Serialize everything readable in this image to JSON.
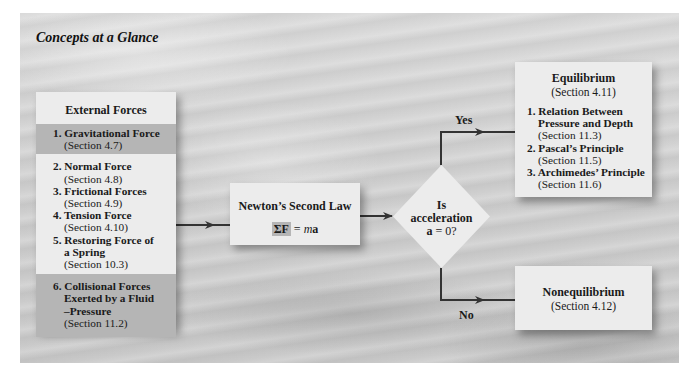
{
  "title": "Concepts at a Glance",
  "external_forces": {
    "header": "External Forces",
    "items": [
      {
        "label": "1. Gravitational Force",
        "section": "(Section 4.7)",
        "highlighted": true
      },
      {
        "label": "2. Normal Force",
        "section": "(Section 4.8)"
      },
      {
        "label": "3. Frictional Forces",
        "section": "(Section 4.9)"
      },
      {
        "label": "4. Tension Force",
        "section": "(Section 4.10)"
      },
      {
        "label": "5. Restoring Force of",
        "label_cont": "a Spring",
        "section": "(Section 10.3)"
      },
      {
        "label": "6. Collisional Forces",
        "label_cont": "Exerted by a Fluid",
        "label_cont2": "–Pressure",
        "section": "(Section 11.2)",
        "highlighted": true
      }
    ]
  },
  "newton": {
    "title": "Newton’s Second Law",
    "formula_sigma": "ΣF",
    "formula_eq": " = ",
    "formula_m": "m",
    "formula_a": "a"
  },
  "decision": {
    "line1": "Is",
    "line2": "acceleration",
    "line3_bold": "a",
    "line3_rest": " = 0?",
    "yes_label": "Yes",
    "no_label": "No"
  },
  "equilibrium": {
    "title": "Equilibrium",
    "section": "(Section 4.11)",
    "items": [
      {
        "label": "1. Relation Between",
        "label_cont": "Pressure and Depth",
        "section": "(Section 11.3)"
      },
      {
        "label": "2. Pascal’s Principle",
        "section": "(Section 11.5)"
      },
      {
        "label": "3. Archimedes’ Principle",
        "section": "(Section 11.6)"
      }
    ]
  },
  "nonequilibrium": {
    "title": "Nonequilibrium",
    "section": "(Section 4.12)"
  },
  "colors": {
    "box": "#ececec",
    "highlight": "#b5b5b5",
    "arrow": "#333333",
    "background": "#d2d2d2"
  }
}
